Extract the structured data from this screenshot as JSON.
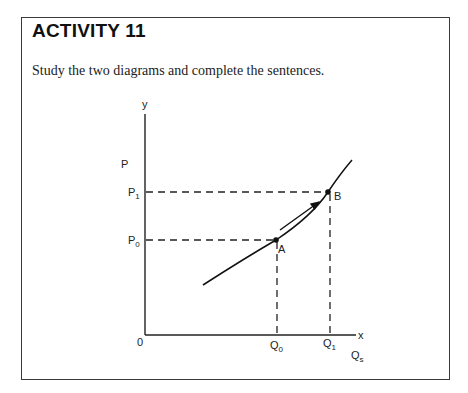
{
  "activity": {
    "title": "ACTIVITY 11",
    "instruction": "Study the two diagrams and complete the sentences."
  },
  "diagram": {
    "axes": {
      "y_label": "y",
      "x_label": "x",
      "origin_label": "0",
      "price_label": "P",
      "quantity_label": "Q",
      "quantity_subscript": "s"
    },
    "price_levels": [
      {
        "base": "P",
        "sub": "1"
      },
      {
        "base": "P",
        "sub": "0"
      }
    ],
    "quantity_levels": [
      {
        "base": "Q",
        "sub": "0"
      },
      {
        "base": "Q",
        "sub": "1"
      }
    ],
    "points": [
      {
        "label": "A",
        "price": "P0",
        "quantity": "Q0"
      },
      {
        "label": "B",
        "price": "P1",
        "quantity": "Q1"
      }
    ],
    "curve": "upward-sloping supply curve",
    "annotation": "arrow along curve from A to B"
  }
}
